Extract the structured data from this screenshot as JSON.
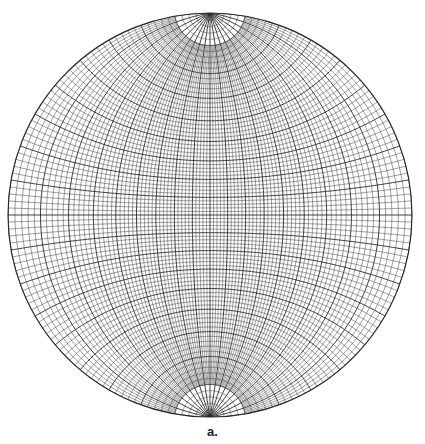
{
  "figure": {
    "type": "Wulff stereographic net (equal-angle projection)",
    "caption": "a.",
    "center": [
      210,
      215
    ],
    "radius": 202,
    "minor_interval_deg": 2,
    "major_interval_deg": 10,
    "polar_cap_small_circle_deg": 80,
    "line_color": "#2a2a2a",
    "minor_line_width": 0.45,
    "major_line_width": 0.9,
    "background": "#ffffff"
  }
}
